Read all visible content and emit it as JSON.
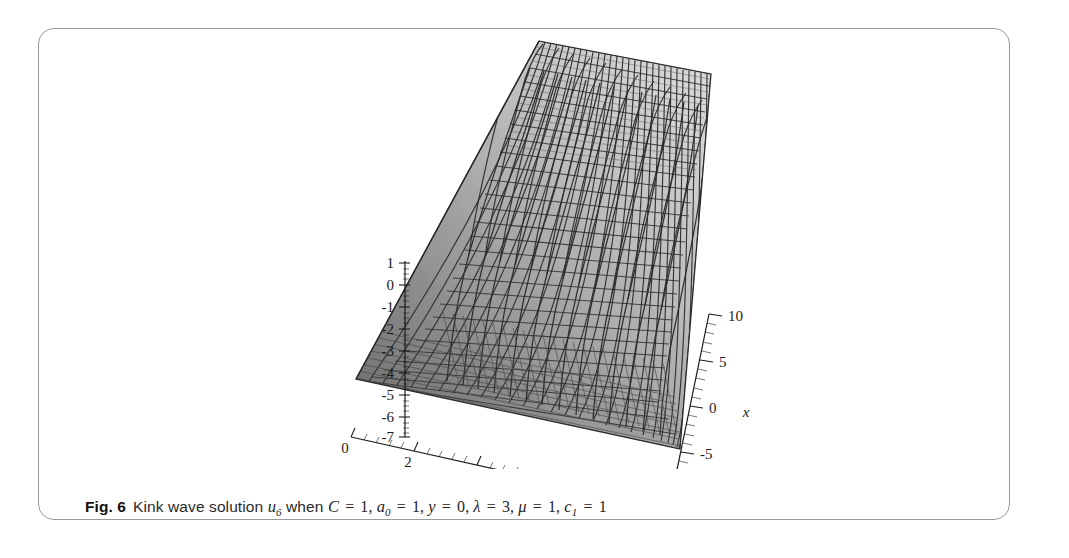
{
  "figure": {
    "label": "Fig. 6",
    "caption_prefix": "Kink wave solution",
    "function_symbol": "u",
    "function_subscript": "6",
    "caption_when": "when",
    "parameters": [
      {
        "symbol": "C",
        "sub": "",
        "eq": "=",
        "value": "1",
        "sep": ","
      },
      {
        "symbol": "a",
        "sub": "0",
        "eq": "=",
        "value": "1",
        "sep": ","
      },
      {
        "symbol": "y",
        "sub": "",
        "eq": "=",
        "value": "0",
        "sep": ","
      },
      {
        "symbol": "λ",
        "sub": "",
        "eq": "=",
        "value": "3",
        "sep": ","
      },
      {
        "symbol": "μ",
        "sub": "",
        "eq": "=",
        "value": "1",
        "sep": ","
      },
      {
        "symbol": "c",
        "sub": "1",
        "eq": "=",
        "value": "1",
        "sep": ""
      }
    ],
    "caption_plain": "Fig. 6  Kink wave solution u6 when C = 1, a0 = 1, y = 0, λ = 3, μ = 1, c1 = 1"
  },
  "chart_data": {
    "type": "surface",
    "title": "",
    "subtitle": "",
    "xlabel": "t",
    "ylabel": "x",
    "zlabel": "",
    "grid": true,
    "legend": false,
    "projection": "3d-wireframe-shaded",
    "colors": {
      "surface_light": "#d9d9d9",
      "surface_mid": "#b3b3b3",
      "surface_dark": "#8a8a8a",
      "surface_darkest": "#6e6e6e",
      "mesh_line": "#333333",
      "axis_line": "#1c1c1c",
      "frame_border": "#9a9a9a",
      "background": "#ffffff",
      "caption_text": "#262626"
    },
    "axes": {
      "t": {
        "label": "t",
        "ticks": [
          0,
          2,
          4,
          6,
          8,
          10
        ],
        "tick_labels": [
          "0",
          "2",
          "4",
          "6",
          "8",
          "10"
        ],
        "range": [
          0,
          10
        ],
        "minor_ticks_per_major": 4
      },
      "x": {
        "label": "x",
        "ticks": [
          10,
          5,
          0,
          -5,
          -10
        ],
        "tick_labels": [
          "10",
          "5",
          "0",
          "-5",
          "-10"
        ],
        "range": [
          -10,
          10
        ],
        "minor_ticks_per_major": 4
      },
      "z": {
        "label": "",
        "ticks": [
          1,
          0,
          -1,
          -2,
          -3,
          -4,
          -5,
          -6,
          -7
        ],
        "tick_labels": [
          "1",
          "0",
          "-1",
          "-2",
          "-3",
          "-4",
          "-5",
          "-6",
          "-7"
        ],
        "range": [
          -7,
          1
        ],
        "minor_ticks_per_major": 4
      }
    }
  }
}
